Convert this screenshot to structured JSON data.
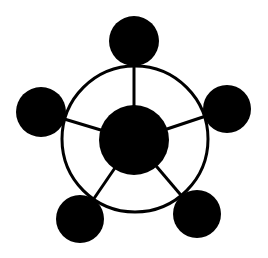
{
  "diagram": {
    "type": "hub-and-spoke network",
    "background": "#ffffff",
    "stroke_color": "#000000",
    "fill_color": "#000000",
    "ring": {
      "cx": 135,
      "cy": 139,
      "r": 73,
      "stroke_width": 3
    },
    "hub": {
      "id": "hub",
      "cx": 134,
      "cy": 140,
      "r": 35
    },
    "nodes": [
      {
        "id": "node-top",
        "cx": 134,
        "cy": 41,
        "r": 25
      },
      {
        "id": "node-right",
        "cx": 227,
        "cy": 109,
        "r": 24
      },
      {
        "id": "node-bottom-right",
        "cx": 197,
        "cy": 214,
        "r": 24
      },
      {
        "id": "node-bottom-left",
        "cx": 80,
        "cy": 219,
        "r": 24
      },
      {
        "id": "node-left",
        "cx": 41,
        "cy": 112,
        "r": 25
      }
    ],
    "spokes": [
      {
        "from": "hub",
        "to": "node-top"
      },
      {
        "from": "hub",
        "to": "node-right"
      },
      {
        "from": "hub",
        "to": "node-bottom-right"
      },
      {
        "from": "hub",
        "to": "node-bottom-left"
      },
      {
        "from": "hub",
        "to": "node-left"
      }
    ],
    "spoke_width": 3
  }
}
